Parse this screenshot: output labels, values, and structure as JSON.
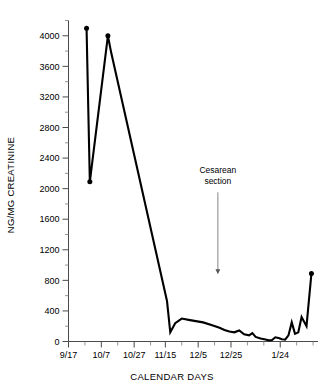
{
  "chart_data": {
    "type": "line",
    "title": "",
    "xlabel": "CALENDAR DAYS",
    "ylabel": "NG/MG CREATININE",
    "ylim": [
      0,
      4200
    ],
    "xlim": [
      0,
      152
    ],
    "grid": false,
    "legend": null,
    "y_ticks_major": [
      0,
      400,
      800,
      1200,
      1600,
      2000,
      2400,
      2800,
      3200,
      3600,
      4000
    ],
    "y_tick_labels": [
      "0",
      "400",
      "800",
      "1200",
      "1600",
      "2000",
      "2400",
      "2800",
      "3200",
      "3600",
      "4000"
    ],
    "y_ticks_minor": [
      200,
      600,
      1000,
      1400,
      1800,
      2200,
      2600,
      3000,
      3400,
      3800,
      4200
    ],
    "x_ticks_major": [
      0,
      20,
      40,
      59,
      79,
      99,
      129
    ],
    "x_tick_labels": [
      "9/17",
      "10/7",
      "10/27",
      "11/15",
      "12/5",
      "12/25",
      "1/24"
    ],
    "x_ticks_minor": [
      10,
      30,
      50,
      69,
      89,
      109,
      119,
      139,
      149
    ],
    "series": [
      {
        "name": "urinary marker",
        "marker": "circle",
        "color": "#000000",
        "x": [
          11,
          13,
          24,
          26,
          60,
          62,
          65,
          69,
          74,
          82,
          88,
          92,
          95,
          98,
          101,
          104,
          107,
          110,
          112,
          114,
          117,
          120,
          122,
          124,
          126,
          128,
          130,
          132,
          134,
          136,
          138,
          140,
          142,
          145,
          148
        ],
        "y": [
          4100,
          2090,
          4000,
          3780,
          530,
          120,
          240,
          300,
          280,
          250,
          210,
          180,
          150,
          130,
          120,
          145,
          95,
          80,
          110,
          60,
          40,
          25,
          15,
          20,
          55,
          45,
          30,
          25,
          80,
          250,
          100,
          120,
          320,
          200,
          890
        ]
      }
    ],
    "annotations": [
      {
        "name": "cesarean-section",
        "text_line1": "Cesarean",
        "text_line2": "section",
        "x": 91,
        "y_text": 2200,
        "y_arrow_tip": 880
      }
    ]
  },
  "axis": {
    "y_title": "NG/MG CREATININE",
    "x_title": "CALENDAR DAYS"
  }
}
